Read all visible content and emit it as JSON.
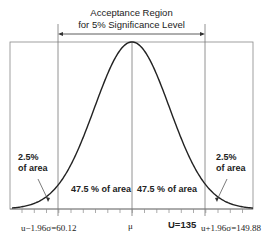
{
  "diagram": {
    "title_line1": "Acceptance Region",
    "title_line2": "for 5% Significance Level",
    "left_tail": {
      "line1": "2.5%",
      "line2": "of area"
    },
    "right_tail": {
      "line1": "2.5%",
      "line2": "of area"
    },
    "center_left": "47.5 % of area",
    "center_right": "47.5 % of area",
    "x_labels": {
      "left": "u−1.96σ=60.12",
      "mean": "μ",
      "U": "U=135",
      "right": "u+1.96σ=149.88"
    }
  }
}
